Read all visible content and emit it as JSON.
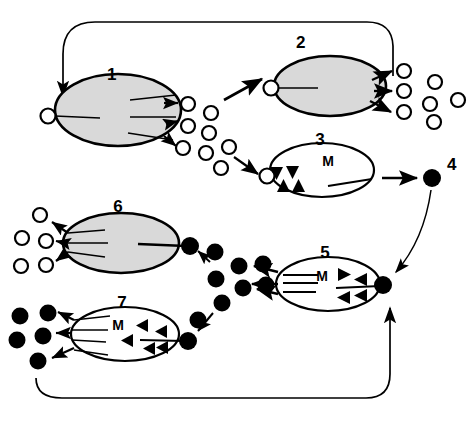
{
  "figure": {
    "background_color": "#ffffff",
    "line_color": "#000000",
    "fill_gray": "#d9d9d9",
    "fill_white": "#ffffff",
    "fill_black": "#000000"
  },
  "stages": [
    {
      "id": "1",
      "label": "1",
      "marker": "",
      "fill": "gray",
      "cx": 118,
      "cy": 110,
      "rx": 63,
      "ry": 36,
      "label_x": 107,
      "label_y": 80
    },
    {
      "id": "2",
      "label": "2",
      "marker": "",
      "fill": "gray",
      "cx": 330,
      "cy": 86,
      "rx": 56,
      "ry": 30,
      "label_x": 296,
      "label_y": 48
    },
    {
      "id": "3",
      "label": "3",
      "marker": "M",
      "fill": "white",
      "cx": 322,
      "cy": 170,
      "rx": 52,
      "ry": 27,
      "label_x": 320,
      "label_y": 145,
      "m_x": 328,
      "m_y": 166
    },
    {
      "id": "4",
      "label": "4",
      "marker": "",
      "fill": "dot",
      "cx": 432,
      "cy": 178,
      "rx": 8,
      "ry": 8,
      "label_x": 447,
      "label_y": 170
    },
    {
      "id": "5",
      "label": "5",
      "marker": "M",
      "fill": "white",
      "cx": 328,
      "cy": 284,
      "rx": 52,
      "ry": 27,
      "label_x": 325,
      "label_y": 258,
      "m_x": 322,
      "m_y": 281
    },
    {
      "id": "6",
      "label": "6",
      "marker": "",
      "fill": "gray",
      "cx": 121,
      "cy": 243,
      "rx": 58,
      "ry": 30,
      "label_x": 118,
      "label_y": 212
    },
    {
      "id": "7",
      "label": "7",
      "marker": "M",
      "fill": "white",
      "cx": 125,
      "cy": 334,
      "rx": 54,
      "ry": 27,
      "label_x": 122,
      "label_y": 308,
      "m_x": 118,
      "m_y": 330
    }
  ],
  "particles": {
    "open_circle_radius": 7,
    "filled_dot_radius": 8,
    "open_circles_stage1_output": [
      {
        "cx": 188,
        "cy": 104
      },
      {
        "cx": 211,
        "cy": 113
      },
      {
        "cx": 188,
        "cy": 126
      },
      {
        "cx": 209,
        "cy": 133
      },
      {
        "cx": 183,
        "cy": 148
      },
      {
        "cx": 206,
        "cy": 153
      },
      {
        "cx": 229,
        "cy": 147
      },
      {
        "cx": 221,
        "cy": 168
      }
    ],
    "open_circles_stage2_output": [
      {
        "cx": 404,
        "cy": 71
      },
      {
        "cx": 435,
        "cy": 82
      },
      {
        "cx": 404,
        "cy": 91
      },
      {
        "cx": 430,
        "cy": 104
      },
      {
        "cx": 458,
        "cy": 100
      },
      {
        "cx": 404,
        "cy": 112
      },
      {
        "cx": 434,
        "cy": 122
      }
    ],
    "open_circles_stage6_output": [
      {
        "cx": 40,
        "cy": 215
      },
      {
        "cx": 22,
        "cy": 238
      },
      {
        "cx": 46,
        "cy": 241
      },
      {
        "cx": 21,
        "cy": 266
      },
      {
        "cx": 46,
        "cy": 265
      }
    ],
    "filled_dots_cluster_middle": [
      {
        "cx": 215,
        "cy": 252
      },
      {
        "cx": 239,
        "cy": 266
      },
      {
        "cx": 263,
        "cy": 264
      },
      {
        "cx": 216,
        "cy": 279
      },
      {
        "cx": 243,
        "cy": 288
      },
      {
        "cx": 266,
        "cy": 285
      },
      {
        "cx": 222,
        "cy": 303
      },
      {
        "cx": 198,
        "cy": 320
      }
    ],
    "filled_dots_stage7_output": [
      {
        "cx": 20,
        "cy": 316
      },
      {
        "cx": 48,
        "cy": 313
      },
      {
        "cx": 43,
        "cy": 336
      },
      {
        "cx": 17,
        "cy": 340
      },
      {
        "cx": 38,
        "cy": 361
      }
    ],
    "attached_dots": [
      {
        "cx": 190,
        "cy": 246,
        "owner": "6"
      },
      {
        "cx": 383,
        "cy": 285,
        "owner": "5"
      },
      {
        "cx": 188,
        "cy": 341,
        "owner": "7"
      }
    ],
    "attached_open_circles": [
      {
        "cx": 48,
        "cy": 116,
        "owner": "1"
      },
      {
        "cx": 271,
        "cy": 88,
        "owner": "2"
      },
      {
        "cx": 267,
        "cy": 176,
        "owner": "3"
      }
    ]
  },
  "triangles": {
    "stage3": [
      {
        "x": 276,
        "y": 173,
        "dir": "down"
      },
      {
        "x": 292,
        "y": 172,
        "dir": "down"
      },
      {
        "x": 283,
        "y": 185,
        "dir": "up"
      },
      {
        "x": 298,
        "y": 185,
        "dir": "up"
      }
    ],
    "stage5": [
      {
        "x": 345,
        "y": 274,
        "dir": "right"
      },
      {
        "x": 360,
        "y": 279,
        "dir": "left"
      },
      {
        "x": 343,
        "y": 297,
        "dir": "left"
      },
      {
        "x": 360,
        "y": 295,
        "dir": "left"
      }
    ],
    "stage7": [
      {
        "x": 141,
        "y": 325,
        "dir": "left"
      },
      {
        "x": 160,
        "y": 331,
        "dir": "left"
      },
      {
        "x": 126,
        "y": 340,
        "dir": "left"
      },
      {
        "x": 148,
        "y": 348,
        "dir": "left"
      },
      {
        "x": 161,
        "y": 346,
        "dir": "left"
      }
    ]
  },
  "flow": {
    "description": "Open circles released from stages 1 and 2; stage 3 divides to give stage 4 dot; dots feed stages 5, 6 and 7; recycling loops run along the top and bottom of the figure.",
    "top_loop": "From stage 2 output region curving left across the top and down into stage 1 input circle",
    "bottom_loop": "From stage 7 output region curving right along the bottom and up into stage 5 attached dot",
    "stage3_to_4": "straight arrow right",
    "stage4_to_5": "curved arrow down-left"
  }
}
